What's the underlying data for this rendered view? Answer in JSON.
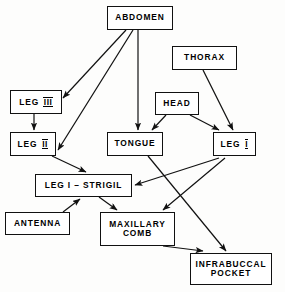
{
  "diagram": {
    "type": "flowchart",
    "background_color": "#fdfdfc",
    "line_color": "#111111",
    "box_fill": "#ffffff",
    "nodes": [
      {
        "id": "abdomen",
        "label": "ABDOMEN",
        "x": 107,
        "y": 6,
        "w": 66,
        "h": 24
      },
      {
        "id": "thorax",
        "label": "THORAX",
        "x": 172,
        "y": 46,
        "w": 65,
        "h": 24
      },
      {
        "id": "leg3",
        "label": "LEG",
        "numeral": "III",
        "x": 10,
        "y": 90,
        "w": 52,
        "h": 24
      },
      {
        "id": "head",
        "label": "HEAD",
        "x": 155,
        "y": 92,
        "w": 44,
        "h": 23
      },
      {
        "id": "leg2",
        "label": "LEG",
        "numeral": "II",
        "x": 10,
        "y": 132,
        "w": 46,
        "h": 24
      },
      {
        "id": "tongue",
        "label": "TONGUE",
        "x": 107,
        "y": 132,
        "w": 56,
        "h": 24
      },
      {
        "id": "leg1",
        "label": "LEG",
        "numeral": "I",
        "x": 213,
        "y": 132,
        "w": 43,
        "h": 24
      },
      {
        "id": "strigil",
        "label": "LEG I – STRIGIL",
        "x": 35,
        "y": 174,
        "w": 97,
        "h": 23
      },
      {
        "id": "antenna",
        "label": "ANTENNA",
        "x": 5,
        "y": 212,
        "w": 65,
        "h": 23
      },
      {
        "id": "maxillary",
        "label": "MAXILLARY\nCOMB",
        "x": 100,
        "y": 212,
        "w": 75,
        "h": 34
      },
      {
        "id": "infra",
        "label": "INFRABUCCAL\nPOCKET",
        "x": 190,
        "y": 253,
        "w": 82,
        "h": 32
      }
    ],
    "edges": [
      {
        "from": "abdomen",
        "to": "leg3",
        "points": "126,30 63,98"
      },
      {
        "from": "abdomen",
        "to": "leg2",
        "points": "133,30 58,150"
      },
      {
        "from": "abdomen",
        "to": "tongue",
        "points": "138,30 138,130"
      },
      {
        "from": "thorax",
        "to": "leg1",
        "points": "203,70 233,130"
      },
      {
        "from": "leg3",
        "to": "leg2",
        "points": "34,114 34,130"
      },
      {
        "from": "head",
        "to": "tongue",
        "points": "166,115 152,130"
      },
      {
        "from": "head",
        "to": "leg1",
        "points": "190,115 219,130"
      },
      {
        "from": "leg2",
        "to": "strigil",
        "points": "52,156 86,172"
      },
      {
        "from": "leg1",
        "to": "strigil",
        "points": "219,158 135,185"
      },
      {
        "from": "leg1",
        "to": "maxillary",
        "points": "225,158 163,210"
      },
      {
        "from": "tongue",
        "to": "infra",
        "points": "148,156 226,251"
      },
      {
        "from": "antenna",
        "to": "strigil",
        "points": "63,212 80,199"
      },
      {
        "from": "strigil",
        "to": "maxillary",
        "points": "99,197 117,210"
      },
      {
        "from": "maxillary",
        "to": "infra",
        "points": "163,246 203,251"
      }
    ]
  }
}
